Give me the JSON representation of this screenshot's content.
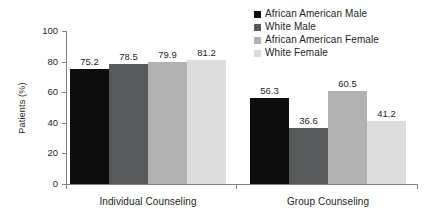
{
  "chart_data": {
    "type": "bar",
    "title": "",
    "subtitle": "",
    "xlabel": "",
    "ylabel": "Patients (%)",
    "ylim": [
      0,
      100
    ],
    "ytick_step": 20,
    "ytick_labels": [
      "0",
      "20",
      "40",
      "60",
      "80",
      "100"
    ],
    "grid": false,
    "legend_position": "top-right",
    "categories": [
      "Individual Counseling",
      "Group Counseling"
    ],
    "series": [
      {
        "name": "African American Male",
        "color": "#0d0d0d",
        "values": [
          75.2,
          78.5
        ],
        "labels": [
          "75.2",
          "56.3"
        ]
      },
      {
        "name": "White Male",
        "color": "#58595b",
        "values": [
          78.5,
          36.6
        ],
        "labels": [
          "78.5",
          "36.6"
        ]
      },
      {
        "name": "African American Female",
        "color": "#b2b2b2",
        "values": [
          79.9,
          60.5
        ],
        "labels": [
          "79.9",
          "60.5"
        ]
      },
      {
        "name": "White Female",
        "color": "#dcdcdc",
        "values": [
          81.2,
          41.2
        ],
        "labels": [
          "81.2",
          "41.2"
        ]
      }
    ],
    "groups": [
      {
        "category": "Individual Counseling",
        "bars": [
          {
            "series": "African American Male",
            "value": 75.2,
            "label": "75.2",
            "color": "#0d0d0d"
          },
          {
            "series": "White Male",
            "value": 78.5,
            "label": "78.5",
            "color": "#58595b"
          },
          {
            "series": "African American Female",
            "value": 79.9,
            "label": "79.9",
            "color": "#b2b2b2"
          },
          {
            "series": "White Female",
            "value": 81.2,
            "label": "81.2",
            "color": "#dcdcdc"
          }
        ]
      },
      {
        "category": "Group Counseling",
        "bars": [
          {
            "series": "African American Male",
            "value": 56.3,
            "label": "56.3",
            "color": "#0d0d0d"
          },
          {
            "series": "White Male",
            "value": 36.6,
            "label": "36.6",
            "color": "#58595b"
          },
          {
            "series": "African American Female",
            "value": 60.5,
            "label": "60.5",
            "color": "#b2b2b2"
          },
          {
            "series": "White Female",
            "value": 41.2,
            "label": "41.2",
            "color": "#dcdcdc"
          }
        ]
      }
    ]
  },
  "axes": {
    "y_title": "Patients (%)",
    "y_ticks": [
      "100",
      "80",
      "60",
      "40",
      "20",
      "0"
    ],
    "x_categories": [
      "Individual Counseling",
      "Group Counseling"
    ]
  },
  "legend": {
    "items": [
      {
        "label": "African American Male",
        "color": "#0d0d0d"
      },
      {
        "label": "White Male",
        "color": "#58595b"
      },
      {
        "label": "African American Female",
        "color": "#b2b2b2"
      },
      {
        "label": "White Female",
        "color": "#dcdcdc"
      }
    ]
  },
  "colors": {
    "axis": "#808285",
    "text": "#231f20",
    "background": "#ffffff"
  }
}
